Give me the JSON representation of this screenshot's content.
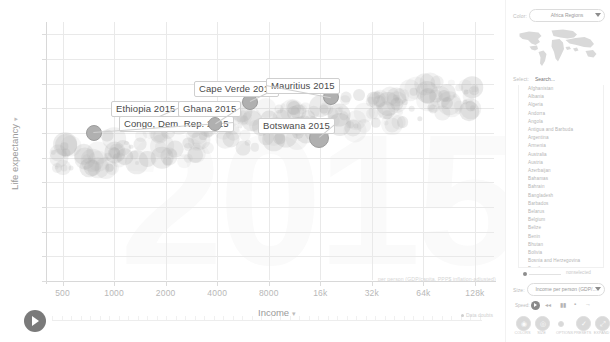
{
  "chart_data": {
    "type": "scatter",
    "title": "",
    "xlabel": "Income",
    "ylabel": "Life expectancy",
    "year": "2015",
    "axis_note": "per person (GDP/capita, PPP$ inflation-adjusted)",
    "x_scale": "log",
    "xticks": [
      "500",
      "1000",
      "2000",
      "4000",
      "8000",
      "16k",
      "32k",
      "64k",
      "128k"
    ],
    "xtick_values": [
      500,
      1000,
      2000,
      4000,
      8000,
      16000,
      32000,
      64000,
      128000
    ],
    "yticks": [
      "0",
      "10",
      "20",
      "30",
      "40",
      "50",
      "60",
      "70",
      "80",
      "90",
      "100"
    ],
    "ylim": [
      0,
      105
    ],
    "grid": true,
    "legend": "none",
    "labeled_points": [
      {
        "name": "Ethiopia 2015",
        "income": 1530,
        "life_expectancy": 64.0,
        "size": 7
      },
      {
        "name": "Congo, Dem. Rep. 2015",
        "income": 760,
        "life_expectancy": 60.0,
        "size": 7
      },
      {
        "name": "Ghana 2015",
        "income": 3900,
        "life_expectancy": 63.5,
        "size": 6
      },
      {
        "name": "Cape Verde 2015",
        "income": 6200,
        "life_expectancy": 72.5,
        "size": 7
      },
      {
        "name": "Mauritius 2015",
        "income": 18500,
        "life_expectancy": 74.5,
        "size": 7
      },
      {
        "name": "Botswana 2015",
        "income": 15800,
        "life_expectancy": 58.0,
        "size": 9
      }
    ]
  },
  "chart": {
    "y_axis_title": "Life expectancy",
    "x_axis_title": "Income",
    "caret": "▾",
    "axis_note": "per person (GDP/capita, PPP$ inflation-adjusted)",
    "year_watermark": "2015",
    "data_doubts": "Data doubts"
  },
  "panel": {
    "color": {
      "label": "Color:",
      "value": "Africa Regions"
    },
    "select": {
      "label": "Select:",
      "search_placeholder": "Search...",
      "countries": [
        "Afghanistan",
        "Albania",
        "Algeria",
        "Andorra",
        "Angola",
        "Antigua and Barbuda",
        "Argentina",
        "Armenia",
        "Australia",
        "Austria",
        "Azerbaijan",
        "Bahamas",
        "Bahrain",
        "Bangladesh",
        "Barbados",
        "Belarus",
        "Belgium",
        "Belize",
        "Benin",
        "Bhutan",
        "Bolivia",
        "Bosnia and Herzegovina",
        "Brazil",
        "Brunei"
      ]
    },
    "opacity": {
      "label": "Opacity",
      "nonselected": "nonselected"
    },
    "size": {
      "label": "Size:",
      "value": "Income per person (GDP/..."
    },
    "speed": {
      "label": "Speed:",
      "icons": [
        "play-icon",
        "rewind-icon",
        "pause-icon",
        "stop-icon",
        "forward-icon"
      ]
    },
    "buttons": [
      {
        "name": "colors-button",
        "caption": "COLORS",
        "glyph": "◉"
      },
      {
        "name": "size-button",
        "caption": "SIZE",
        "glyph": "◎"
      },
      {
        "name": "options-button",
        "caption": "OPTIONS",
        "glyph": "·"
      },
      {
        "name": "presets-button",
        "caption": "PRESETS",
        "glyph": "✓"
      },
      {
        "name": "expand-button",
        "caption": "EXPAND",
        "glyph": "⤢"
      }
    ]
  },
  "timeline": {
    "play_label": "play-button"
  }
}
